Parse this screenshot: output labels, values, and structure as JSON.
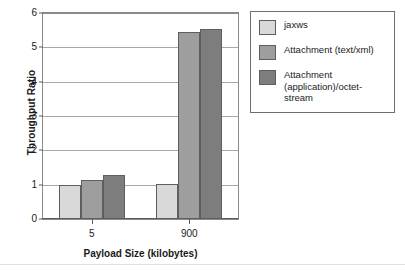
{
  "chart_data": {
    "type": "bar",
    "title": "",
    "subtitle": "",
    "xlabel": "Payload Size (kilobytes)",
    "ylabel": "Throughput Ratio",
    "categories": [
      "5",
      "900"
    ],
    "ylim": [
      0,
      6
    ],
    "yticks": [
      0,
      1,
      2,
      3,
      4,
      5,
      6
    ],
    "ytick_labels": [
      "0",
      "1",
      "2",
      "3",
      "4",
      "5",
      "6"
    ],
    "grid": true,
    "grid_axis": "y",
    "legend_position": "right",
    "series": [
      {
        "name": "jaxws",
        "color": "#d9d9d9",
        "values": [
          1.0,
          1.02
        ]
      },
      {
        "name": "Attachment (text/xml)",
        "color": "#9e9e9e",
        "values": [
          1.15,
          5.45
        ]
      },
      {
        "name": "Attachment (application)/octet-stream",
        "color": "#7d7d7d",
        "values": [
          1.29,
          5.53
        ]
      }
    ]
  },
  "legend": {
    "entries": [
      {
        "label": "jaxws",
        "color": "#d9d9d9"
      },
      {
        "label": "Attachment (text/xml)",
        "color": "#9e9e9e"
      },
      {
        "label": "Attachment (application)/octet-stream",
        "color": "#7d7d7d"
      }
    ]
  },
  "axes": {
    "y_title": "Throughput Ratio",
    "x_title": "Payload Size (kilobytes)"
  }
}
